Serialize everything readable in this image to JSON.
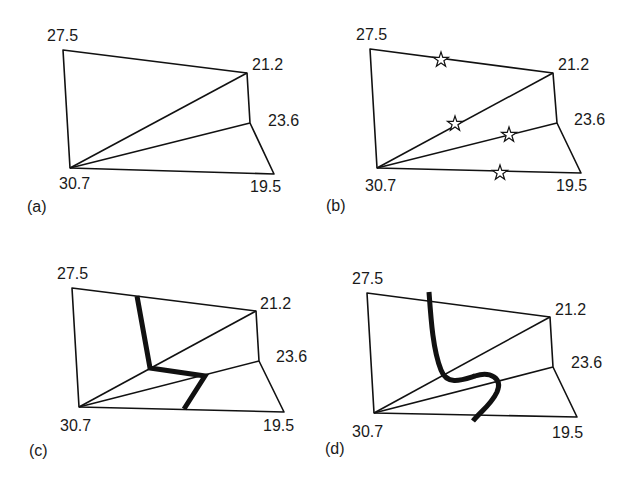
{
  "panels": [
    {
      "id": "a",
      "caption": "(a)",
      "values": {
        "top_left": "27.5",
        "top_right": "21.2",
        "mid_right": "23.6",
        "bottom_left": "30.7",
        "bottom_right": "19.5"
      }
    },
    {
      "id": "b",
      "caption": "(b)",
      "values": {
        "top_left": "27.5",
        "top_right": "21.2",
        "mid_right": "23.6",
        "bottom_left": "30.7",
        "bottom_right": "19.5"
      },
      "markers": "star markers on edges crossed by contour"
    },
    {
      "id": "c",
      "caption": "(c)",
      "values": {
        "top_left": "27.5",
        "top_right": "21.2",
        "mid_right": "23.6",
        "bottom_left": "30.7",
        "bottom_right": "19.5"
      },
      "contour": "straight-segment interpolated contour"
    },
    {
      "id": "d",
      "caption": "(d)",
      "values": {
        "top_left": "27.5",
        "top_right": "21.2",
        "mid_right": "23.6",
        "bottom_left": "30.7",
        "bottom_right": "19.5"
      },
      "contour": "smoothed curved contour"
    }
  ],
  "colors": {
    "line": "#111111",
    "background": "#ffffff"
  }
}
